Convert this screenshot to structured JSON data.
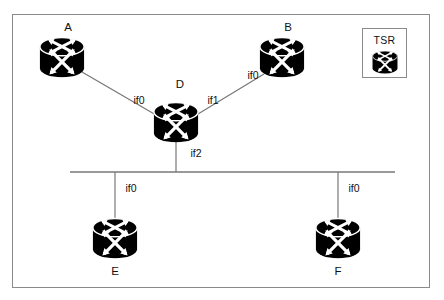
{
  "diagram": {
    "background_color": "#ffffff",
    "border_color": "#8a8a8a",
    "link_color": "#777777",
    "router_color": "#000000",
    "text_color": "#111111"
  },
  "nodes": [
    {
      "id": "A",
      "label": "A",
      "x": 62,
      "y": 57,
      "label_x": 68,
      "label_y": 28,
      "icon": "router-icon",
      "size": "large"
    },
    {
      "id": "B",
      "label": "B",
      "x": 282,
      "y": 57,
      "label_x": 288,
      "label_y": 28,
      "icon": "router-icon",
      "size": "large"
    },
    {
      "id": "D",
      "label": "D",
      "x": 176,
      "y": 122,
      "label_x": 180,
      "label_y": 85,
      "icon": "router-icon",
      "size": "large"
    },
    {
      "id": "E",
      "label": "E",
      "x": 115,
      "y": 238,
      "label_x": 115,
      "label_y": 272,
      "icon": "router-icon",
      "size": "large"
    },
    {
      "id": "F",
      "label": "F",
      "x": 338,
      "y": 238,
      "label_x": 338,
      "label_y": 272,
      "icon": "router-icon",
      "size": "large"
    }
  ],
  "links": [
    {
      "from": "A",
      "to": "D",
      "x1": 82,
      "y1": 72,
      "x2": 156,
      "y2": 115
    },
    {
      "from": "B",
      "to": "D",
      "x1": 264,
      "y1": 74,
      "x2": 198,
      "y2": 114
    },
    {
      "from": "D",
      "to": "bus",
      "x1": 176,
      "y1": 140,
      "x2": 176,
      "y2": 172
    },
    {
      "from": "E",
      "to": "bus",
      "x1": 115,
      "y1": 172,
      "x2": 115,
      "y2": 222
    },
    {
      "from": "F",
      "to": "bus",
      "x1": 338,
      "y1": 172,
      "x2": 338,
      "y2": 222
    }
  ],
  "bus": {
    "x1": 70,
    "y1": 172,
    "x2": 395,
    "y2": 172
  },
  "interface_labels": [
    {
      "text": "if0",
      "x": 139,
      "y": 100,
      "belongs_to": "D"
    },
    {
      "text": "if1",
      "x": 213,
      "y": 100,
      "belongs_to": "D"
    },
    {
      "text": "if2",
      "x": 196,
      "y": 153,
      "belongs_to": "D"
    },
    {
      "text": "if0",
      "x": 253,
      "y": 75,
      "belongs_to": "B"
    },
    {
      "text": "if0",
      "x": 131,
      "y": 188,
      "belongs_to": "E"
    },
    {
      "text": "if0",
      "x": 354,
      "y": 188,
      "belongs_to": "F"
    }
  ],
  "legend": {
    "title": "TSR",
    "icon": "router-icon"
  }
}
